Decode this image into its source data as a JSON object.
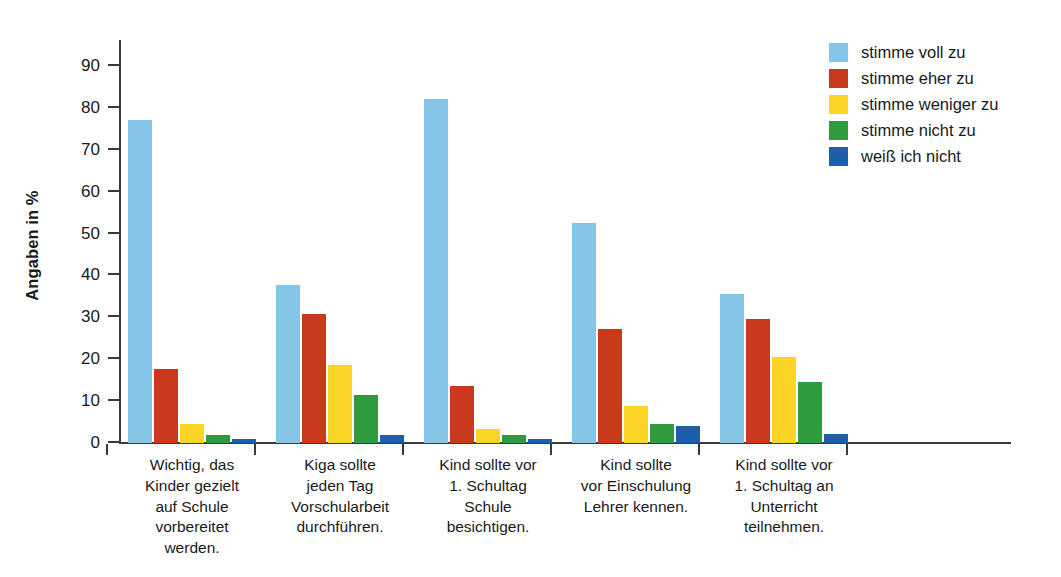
{
  "chart_data": {
    "type": "bar",
    "title": "",
    "xlabel": "",
    "ylabel": "Angaben in %",
    "ylim": [
      0,
      95
    ],
    "yticks": [
      0,
      10,
      20,
      30,
      40,
      50,
      60,
      70,
      80,
      90
    ],
    "ytick_labels": [
      "0",
      "10",
      "20",
      "30",
      "40",
      "50",
      "60",
      "70",
      "80",
      "90"
    ],
    "grid": false,
    "legend_position": "top-right",
    "categories": [
      "Wichtig, das\nKinder gezielt\nauf Schule\nvorbereitet\nwerden.",
      "Kiga sollte\njeden Tag\nVorschularbeit\ndurchführen.",
      "Kind sollte vor\n1. Schultag\nSchule\nbesichtigen.",
      "Kind sollte\nvor Einschulung\nLehrer kennen.",
      "Kind sollte vor\n1. Schultag an\nUnterricht\nteilnehmen."
    ],
    "series": [
      {
        "name": "stimme voll zu",
        "color": "#85C6E8",
        "values": [
          77.1,
          37.7,
          82.2,
          52.4,
          35.5
        ]
      },
      {
        "name": "stimme eher zu",
        "color": "#C8391C",
        "values": [
          17.6,
          30.8,
          13.5,
          27.1,
          29.7
        ]
      },
      {
        "name": "stimme weniger zu",
        "color": "#FBD526",
        "values": [
          4.5,
          18.6,
          3.3,
          8.9,
          20.6
        ]
      },
      {
        "name": "stimme nicht zu",
        "color": "#2E9B3F",
        "values": [
          1.9,
          11.5,
          1.9,
          4.5,
          14.5
        ]
      },
      {
        "name": "weiß ich nicht",
        "color": "#1B5FA8",
        "values": [
          1.0,
          1.8,
          1.0,
          4.1,
          2.1
        ]
      }
    ]
  },
  "legend": {
    "items": [
      {
        "label": "stimme voll zu",
        "color": "#85C6E8"
      },
      {
        "label": "stimme eher zu",
        "color": "#C8391C"
      },
      {
        "label": "stimme weniger zu",
        "color": "#FBD526"
      },
      {
        "label": "stimme nicht zu",
        "color": "#2E9B3F"
      },
      {
        "label": "weiß ich nicht",
        "color": "#1B5FA8"
      }
    ]
  }
}
